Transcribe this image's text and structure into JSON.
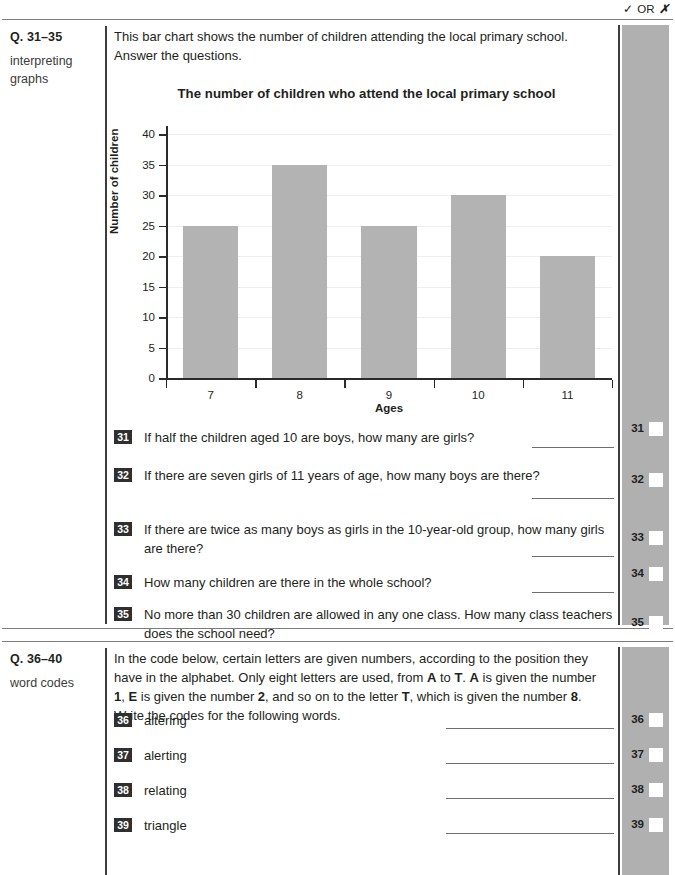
{
  "header": {
    "tick_glyph": "✓",
    "or_text": "OR",
    "cross_glyph": "✗"
  },
  "sections": [
    {
      "id": "section-1",
      "label_title": "Q. 31–35",
      "label_sub": "interpreting graphs",
      "intro": "This bar chart shows the number of children attending the local primary school. Answer the questions.",
      "questions": [
        {
          "number": "31",
          "text": "If half the children aged 10 are boys, how many are girls?"
        },
        {
          "number": "32",
          "text": "If there are seven girls of 11 years of age, how many boys are there?"
        },
        {
          "number": "33",
          "text": "If there are twice as many boys as girls in the 10-year-old group, how many girls are there?"
        },
        {
          "number": "34",
          "text": "How many children are there in the whole school?"
        },
        {
          "number": "35",
          "text": "No more than 30 children are allowed in any one class. How many class teachers does the school need?"
        }
      ],
      "mark_numbers": [
        "31",
        "32",
        "33",
        "34",
        "35"
      ]
    },
    {
      "id": "section-2",
      "label_title": "Q. 36–40",
      "label_sub": "word codes",
      "intro_parts": [
        {
          "t": "In the code below, certain letters are given numbers, according to the position they have in the alphabet. Only eight letters are used, from ",
          "b": false
        },
        {
          "t": "A",
          "b": true
        },
        {
          "t": " to ",
          "b": false
        },
        {
          "t": "T",
          "b": true
        },
        {
          "t": ". ",
          "b": false
        },
        {
          "t": "A",
          "b": true
        },
        {
          "t": " is given the number ",
          "b": false
        },
        {
          "t": "1",
          "b": true
        },
        {
          "t": ", ",
          "b": false
        },
        {
          "t": "E",
          "b": true
        },
        {
          "t": " is given the number ",
          "b": false
        },
        {
          "t": "2",
          "b": true
        },
        {
          "t": ", and so on to the letter ",
          "b": false
        },
        {
          "t": "T",
          "b": true
        },
        {
          "t": ", which is given the number ",
          "b": false
        },
        {
          "t": "8",
          "b": true
        },
        {
          "t": ". Write the codes for the following words.",
          "b": false
        }
      ],
      "questions": [
        {
          "number": "36",
          "text": "altering"
        },
        {
          "number": "37",
          "text": "alerting"
        },
        {
          "number": "38",
          "text": "relating"
        },
        {
          "number": "39",
          "text": "triangle"
        }
      ],
      "mark_numbers": [
        "36",
        "37",
        "38",
        "39"
      ]
    }
  ],
  "chart_data": {
    "type": "bar",
    "title": "The number of children who attend the local primary school",
    "xlabel": "Ages",
    "ylabel": "Number of children",
    "categories": [
      "7",
      "8",
      "9",
      "10",
      "11"
    ],
    "values": [
      25,
      35,
      25,
      30,
      20
    ],
    "ylim": [
      0,
      40
    ],
    "yticks": [
      0,
      5,
      10,
      15,
      20,
      25,
      30,
      35,
      40
    ],
    "grid": true,
    "legend": "none",
    "bar_color": "#b3b3b3"
  }
}
